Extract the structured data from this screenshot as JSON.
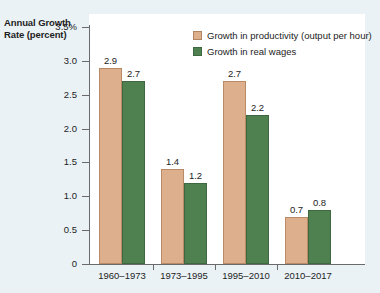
{
  "chart_data": {
    "type": "bar",
    "title": "",
    "ylabel": "Annual Growth Rate (percent)",
    "xlabel": "",
    "categories": [
      "1960–1973",
      "1973–1995",
      "1995–2010",
      "2010–2017"
    ],
    "series": [
      {
        "name": "Growth in productivity (output per hour)",
        "color": "#ddaf8c",
        "values": [
          2.9,
          1.4,
          2.7,
          0.7
        ],
        "labels": [
          "2.9",
          "1.4",
          "2.7",
          "0.7"
        ]
      },
      {
        "name": "Growth in real wages",
        "color": "#4e8050",
        "values": [
          2.7,
          1.2,
          2.2,
          0.8
        ],
        "labels": [
          "2.7",
          "1.2",
          "2.2",
          "0.8"
        ]
      }
    ],
    "ylim": [
      0,
      3.5
    ],
    "ytick_values": [
      3.5,
      3.0,
      2.5,
      2.0,
      1.5,
      1.0,
      0.5,
      0
    ],
    "ytick_labels": [
      "3.5%",
      "3.0",
      "2.5",
      "2.0",
      "1.5",
      "1.0",
      "0.5",
      "0"
    ],
    "grid": false,
    "legend_position": "top-right"
  },
  "axis": {
    "y_title_line1": "Annual Growth",
    "y_title_line2": "Rate (percent)"
  },
  "legend": {
    "items": [
      {
        "label": "Growth in productivity (output per hour)"
      },
      {
        "label": "Growth in real wages"
      }
    ]
  }
}
